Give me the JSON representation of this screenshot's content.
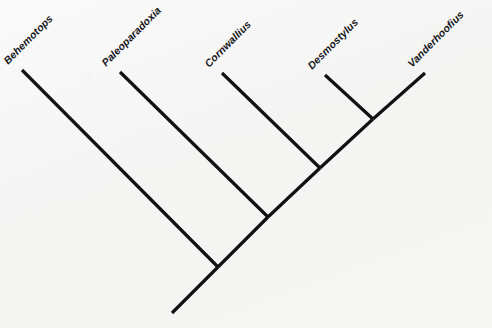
{
  "figure": {
    "type": "cladogram",
    "background_color": "#f6f6f5",
    "line_color": "#111111",
    "label_color": "#16161a"
  },
  "taxa": [
    {
      "name": "Behemotops",
      "label_x": 10,
      "label_y": 66,
      "tip_x": 22,
      "tip_y": 70
    },
    {
      "name": "Paleoparadoxia",
      "label_x": 108,
      "label_y": 68,
      "tip_x": 120,
      "tip_y": 72
    },
    {
      "name": "Cornwallius",
      "label_x": 211,
      "label_y": 69,
      "tip_x": 222,
      "tip_y": 73
    },
    {
      "name": "Desmostylus",
      "label_x": 314,
      "label_y": 71,
      "tip_x": 325,
      "tip_y": 75
    },
    {
      "name": "Vanderhoofius",
      "label_x": 414,
      "label_y": 69,
      "tip_x": 425,
      "tip_y": 73
    }
  ],
  "nodes": [
    {
      "id": "root",
      "x": 218,
      "y": 267
    },
    {
      "id": "node2",
      "x": 268,
      "y": 217
    },
    {
      "id": "node3",
      "x": 320,
      "y": 168
    },
    {
      "id": "node4",
      "x": 373,
      "y": 119
    }
  ],
  "root_stem": {
    "x1": 218,
    "y1": 267,
    "x2": 172,
    "y2": 313
  },
  "branches": [
    {
      "taxon": "Behemotops",
      "x1": 22,
      "y1": 70,
      "x2": 218,
      "y2": 267
    },
    {
      "taxon": "Paleoparadoxia",
      "x1": 120,
      "y1": 72,
      "x2": 268,
      "y2": 217
    },
    {
      "taxon": "Cornwallius",
      "x1": 222,
      "y1": 73,
      "x2": 320,
      "y2": 168
    },
    {
      "taxon": "Desmostylus",
      "x1": 325,
      "y1": 75,
      "x2": 373,
      "y2": 119
    },
    {
      "taxon": "Vanderhoofius",
      "x1": 425,
      "y1": 73,
      "x2": 373,
      "y2": 119
    }
  ],
  "internal_branches": [
    {
      "from": "root",
      "to": "node2",
      "x1": 218,
      "y1": 267,
      "x2": 268,
      "y2": 217
    },
    {
      "from": "node2",
      "to": "node3",
      "x1": 268,
      "y1": 217,
      "x2": 320,
      "y2": 168
    },
    {
      "from": "node3",
      "to": "node4",
      "x1": 320,
      "y1": 168,
      "x2": 373,
      "y2": 119
    }
  ],
  "label_rotation_deg": -45,
  "line_width": 3.2
}
